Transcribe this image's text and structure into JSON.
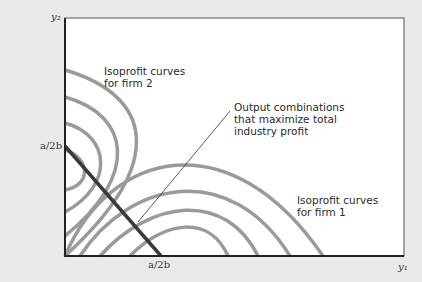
{
  "diagram": {
    "type": "isoprofit-diagram",
    "axes": {
      "x_label": "y₁",
      "y_label": "y₂"
    },
    "ticks": {
      "x_tick": "a/2b",
      "y_tick": "a/2b"
    },
    "annotations": {
      "firm2_line1": "Isoprofit curves",
      "firm2_line2": "for firm 2",
      "firm1_line1": "Isoprofit curves",
      "firm1_line2": "for firm 1",
      "max_line1": "Output combinations",
      "max_line2": "that maximize total",
      "max_line3": "industry profit"
    },
    "colors": {
      "background": "#e9e9e9",
      "plot_area": "#ffffff",
      "curves": "#9a9a9a",
      "profit_line": "#3a3a3a",
      "axes": "#222222"
    },
    "firm2_curves_count": 4,
    "firm1_curves_count": 4
  }
}
